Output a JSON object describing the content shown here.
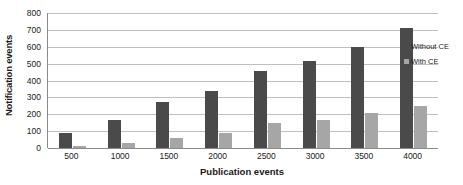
{
  "chart_data": {
    "type": "bar",
    "title": "",
    "xlabel": "Publication events",
    "ylabel": "Notification events",
    "categories": [
      "500",
      "1000",
      "1500",
      "2000",
      "2500",
      "3000",
      "3500",
      "4000"
    ],
    "series": [
      {
        "name": "Without CE",
        "color": "#4a4a4a",
        "values": [
          90,
          165,
          270,
          340,
          455,
          515,
          600,
          710
        ]
      },
      {
        "name": "With CE",
        "color": "#a6a6a6",
        "values": [
          10,
          28,
          60,
          88,
          150,
          165,
          210,
          250
        ]
      }
    ],
    "ylim": [
      0,
      800
    ],
    "ytick_labels": [
      "0",
      "100",
      "200",
      "300",
      "400",
      "500",
      "600",
      "700",
      "800"
    ],
    "ytick_values": [
      0,
      100,
      200,
      300,
      400,
      500,
      600,
      700,
      800
    ],
    "grid": true,
    "legend_position": "right"
  }
}
